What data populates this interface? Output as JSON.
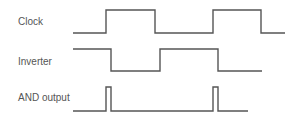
{
  "diagram": {
    "type": "timing-diagram",
    "colors": {
      "line": "#555555",
      "text": "#555555",
      "background": "#ffffff"
    },
    "signals": [
      {
        "name": "Clock",
        "label_pos": [
          18,
          16
        ],
        "points": "73,33 106,33 106,10 155,10 155,33 213,33 213,10 261,10 261,33 285,33"
      },
      {
        "name": "Inverter",
        "label_pos": [
          18,
          56
        ],
        "points": "73,49 111,49 111,71 160,71 160,49 218,49 218,71 262,71"
      },
      {
        "name": "AND output",
        "label_pos": [
          18,
          92
        ],
        "points": "73,111 106,111 106,87 111,87 111,111 213,111 213,87 218,87 218,111 248,111"
      }
    ]
  }
}
